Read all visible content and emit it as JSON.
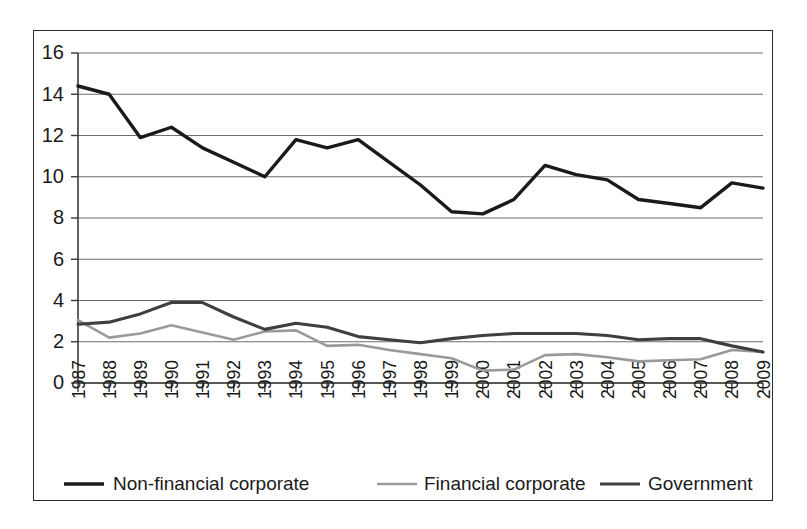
{
  "chart_data": {
    "type": "line",
    "title": "",
    "subtitle": "",
    "xlabel": "",
    "ylabel": "",
    "grid": true,
    "legend_position": "bottom",
    "xlim": [
      1987,
      2009
    ],
    "ylim": [
      0,
      16
    ],
    "ytick_step": 2,
    "yticks": [
      0,
      2,
      4,
      6,
      8,
      10,
      12,
      14,
      16
    ],
    "ytick_labels": [
      "0",
      "2",
      "4",
      "6",
      "8",
      "10",
      "12",
      "14",
      "16"
    ],
    "x": [
      1987,
      1988,
      1989,
      1990,
      1991,
      1992,
      1993,
      1994,
      1995,
      1996,
      1997,
      1998,
      1999,
      2000,
      2001,
      2002,
      2003,
      2004,
      2005,
      2006,
      2007,
      2008,
      2009
    ],
    "categories": [
      "1987",
      "1988",
      "1989",
      "1990",
      "1991",
      "1992",
      "1993",
      "1994",
      "1995",
      "1996",
      "1997",
      "1998",
      "1999",
      "2000",
      "2001",
      "2002",
      "2003",
      "2004",
      "2005",
      "2006",
      "2007",
      "2008",
      "2009"
    ],
    "series": [
      {
        "name": "Non-financial corporate",
        "color": "#1a1a1a",
        "width": 3.4,
        "values": [
          14.4,
          14.0,
          11.9,
          12.4,
          11.4,
          10.7,
          10.0,
          11.8,
          11.4,
          11.8,
          10.7,
          9.6,
          8.3,
          8.2,
          8.9,
          10.55,
          10.1,
          9.85,
          8.9,
          8.7,
          8.5,
          9.7,
          9.45
        ]
      },
      {
        "name": "Financial corporate",
        "color": "#9a9a9a",
        "width": 2.6,
        "values": [
          3.05,
          2.2,
          2.4,
          2.8,
          2.45,
          2.1,
          2.5,
          2.55,
          1.8,
          1.85,
          1.6,
          1.4,
          1.2,
          0.6,
          0.65,
          1.35,
          1.4,
          1.25,
          1.05,
          1.1,
          1.15,
          1.6,
          1.5
        ]
      },
      {
        "name": "Government",
        "color": "#3f3f3f",
        "width": 3.1,
        "values": [
          2.85,
          2.95,
          3.35,
          3.9,
          3.9,
          3.2,
          2.6,
          2.9,
          2.7,
          2.25,
          2.1,
          1.95,
          2.15,
          2.3,
          2.4,
          2.4,
          2.4,
          2.3,
          2.1,
          2.15,
          2.15,
          1.8,
          1.5
        ]
      }
    ]
  },
  "legend": {
    "items": [
      {
        "label": "Non-financial corporate"
      },
      {
        "label": "Financial corporate"
      },
      {
        "label": "Government"
      }
    ]
  }
}
